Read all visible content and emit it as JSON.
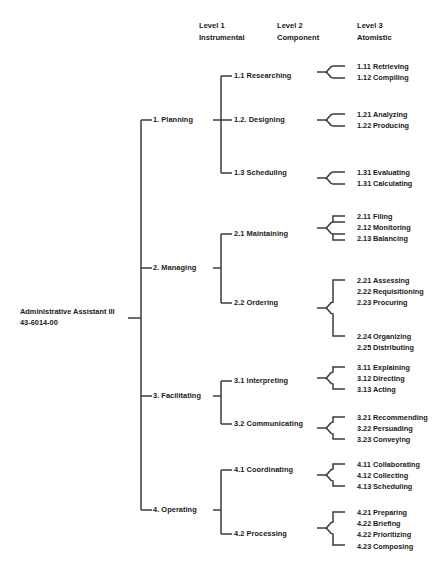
{
  "diagram": {
    "title_root": {
      "line1": "Administrative Assistant III",
      "line2": "43-6014-00"
    },
    "column_headers": [
      {
        "line1": "Level 1",
        "line2": "Instrumental"
      },
      {
        "line1": "Level 2",
        "line2": "Component"
      },
      {
        "line1": "Level 3",
        "line2": "Atomistic"
      }
    ],
    "level1": [
      {
        "label": "1.  Planning"
      },
      {
        "label": "2.  Managing"
      },
      {
        "label": "3.  Facilitating"
      },
      {
        "label": "4.  Operating"
      }
    ],
    "level2": [
      {
        "label": "1.1  Researching"
      },
      {
        "label": "1.2.  Designing"
      },
      {
        "label": "1.3  Scheduling"
      },
      {
        "label": "2.1  Maintaining"
      },
      {
        "label": "2.2  Ordering"
      },
      {
        "label": "3.1  Interpreting"
      },
      {
        "label": "3.2  Communicating"
      },
      {
        "label": "4.1  Coordinating"
      },
      {
        "label": "4.2  Processing"
      }
    ],
    "level3_groups": [
      {
        "parent": "1.1  Researching",
        "items": [
          {
            "num": "1.11",
            "label": "Retrieving"
          },
          {
            "num": "1.12",
            "label": "Compiling"
          }
        ]
      },
      {
        "parent": "1.2.  Designing",
        "items": [
          {
            "num": "1.21",
            "label": "Analyzing"
          },
          {
            "num": "1.22",
            "label": "Producing"
          }
        ]
      },
      {
        "parent": "1.3  Scheduling",
        "items": [
          {
            "num": "1.31",
            "label": "Evaluating"
          },
          {
            "num": "1.31",
            "label": "Calculating"
          }
        ]
      },
      {
        "parent": "2.1  Maintaining",
        "items": [
          {
            "num": "2.11",
            "label": "Filing"
          },
          {
            "num": "2.12",
            "label": "Monitoring"
          },
          {
            "num": "2.13",
            "label": "Balancing"
          }
        ]
      },
      {
        "parent": "2.2  Ordering",
        "items": [
          {
            "num": "2.21",
            "label": "Assessing"
          },
          {
            "num": "2.22",
            "label": "Requisitioning"
          },
          {
            "num": "2.23",
            "label": "Procuring"
          },
          {
            "num": "2.24",
            "label": "Organizing"
          },
          {
            "num": "2.25",
            "label": "Distributing"
          }
        ]
      },
      {
        "parent": "3.1  Interpreting",
        "items": [
          {
            "num": "3.11",
            "label": "Explaining"
          },
          {
            "num": "3.12",
            "label": "Directing"
          },
          {
            "num": "3.13",
            "label": "Acting"
          }
        ]
      },
      {
        "parent": "3.2  Communicating",
        "items": [
          {
            "num": "3.21",
            "label": "Recommending"
          },
          {
            "num": "3.22",
            "label": "Persuading"
          },
          {
            "num": "3.23",
            "label": "Conveying"
          }
        ]
      },
      {
        "parent": "4.1  Coordinating",
        "items": [
          {
            "num": "4.11",
            "label": "Collaborating"
          },
          {
            "num": "4.12",
            "label": "Collecting"
          },
          {
            "num": "4.13",
            "label": "Scheduling"
          }
        ]
      },
      {
        "parent": "4.2  Processing",
        "items": [
          {
            "num": "4.21",
            "label": "Preparing"
          },
          {
            "num": "4.22",
            "label": "Briefing"
          },
          {
            "num": "4.22",
            "label": "Prioritizing"
          },
          {
            "num": "4.23",
            "label": "Composing"
          }
        ]
      }
    ],
    "colors": {
      "text": "#1a1a1a",
      "line": "#3b3b3b",
      "background": "#ffffff"
    }
  }
}
